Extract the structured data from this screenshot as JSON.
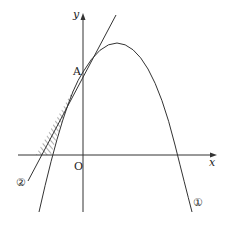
{
  "diagram": {
    "labels": {
      "x_axis": "x",
      "y_axis": "y",
      "origin": "O",
      "point_a": "A",
      "curve_1": "①",
      "curve_2": "②"
    },
    "colors": {
      "stroke": "#333333",
      "background": "#ffffff"
    }
  }
}
